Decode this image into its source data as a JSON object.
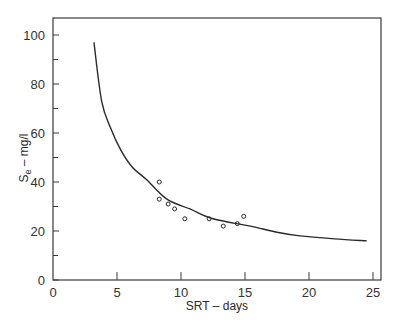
{
  "chart_data": {
    "type": "scatter",
    "title": "",
    "xlabel": "SRT – days",
    "ylabel_main": "S",
    "ylabel_sub": "e",
    "ylabel_rest": " – mg/l",
    "xlim": [
      0,
      25.5
    ],
    "ylim": [
      0,
      107
    ],
    "grid": false,
    "legend": null,
    "x_ticks": [
      0,
      5,
      10,
      15,
      20,
      25
    ],
    "x_tick_labels": [
      "0",
      "5",
      "10",
      "15",
      "20",
      "25"
    ],
    "y_ticks": [
      0,
      20,
      40,
      60,
      80,
      100
    ],
    "y_tick_labels": [
      "0",
      "20",
      "40",
      "60",
      "80",
      "100"
    ],
    "y_minor_ticks": [
      10,
      30,
      50,
      70,
      90
    ],
    "series": [
      {
        "name": "Observed data",
        "kind": "scatter",
        "marker": "open-circle",
        "points": [
          {
            "x": 8.3,
            "y": 40
          },
          {
            "x": 8.3,
            "y": 33
          },
          {
            "x": 9.0,
            "y": 31
          },
          {
            "x": 9.5,
            "y": 29
          },
          {
            "x": 10.3,
            "y": 25
          },
          {
            "x": 12.2,
            "y": 25
          },
          {
            "x": 13.3,
            "y": 22
          },
          {
            "x": 14.4,
            "y": 23
          },
          {
            "x": 14.9,
            "y": 26
          }
        ]
      },
      {
        "name": "Model curve",
        "kind": "line",
        "points": [
          {
            "x": 3.2,
            "y": 97
          },
          {
            "x": 3.8,
            "y": 73
          },
          {
            "x": 4.5,
            "y": 62
          },
          {
            "x": 5.3,
            "y": 53
          },
          {
            "x": 6.2,
            "y": 46
          },
          {
            "x": 7.3,
            "y": 41
          },
          {
            "x": 8.9,
            "y": 33
          },
          {
            "x": 10.7,
            "y": 29
          },
          {
            "x": 12.5,
            "y": 25
          },
          {
            "x": 15.4,
            "y": 22
          },
          {
            "x": 17.5,
            "y": 19.5
          },
          {
            "x": 19.3,
            "y": 18
          },
          {
            "x": 22.0,
            "y": 16.8
          },
          {
            "x": 24.5,
            "y": 16
          }
        ]
      }
    ]
  },
  "colors": {
    "line": "#2a2a2a",
    "axis": "#3a3a3a",
    "background": "#ffffff"
  }
}
